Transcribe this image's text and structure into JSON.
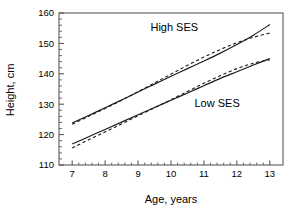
{
  "chart_data": {
    "type": "line",
    "title": "",
    "xlabel": "Age, years",
    "ylabel": "Height, cm",
    "xlim": [
      6.6,
      13.4
    ],
    "ylim": [
      110,
      160
    ],
    "xticks": [
      7,
      8,
      9,
      10,
      11,
      12,
      13
    ],
    "yticks": [
      110,
      120,
      130,
      140,
      150,
      160
    ],
    "xtick_labels": [
      "7",
      "8",
      "9",
      "10",
      "11",
      "12",
      "13"
    ],
    "ytick_labels": [
      "110",
      "120",
      "130",
      "140",
      "150",
      "160"
    ],
    "x_minor_step": 0.2,
    "y_minor_step": 2,
    "grid": false,
    "legend_position": "inline-annotations",
    "annotations": [
      {
        "text": "High SES",
        "x": 10.1,
        "y": 154.2
      },
      {
        "text": "Low SES",
        "x": 11.4,
        "y": 129.2
      }
    ],
    "series": [
      {
        "name": "High SES observed",
        "style": "solid",
        "x": [
          7.0,
          7.5,
          8.0,
          8.5,
          9.0,
          9.5,
          10.0,
          10.5,
          11.0,
          11.5,
          12.0,
          12.5,
          13.0
        ],
        "y": [
          123.8,
          126.3,
          128.8,
          131.4,
          134.0,
          136.6,
          139.2,
          141.7,
          144.2,
          146.8,
          149.6,
          152.7,
          156.2
        ]
      },
      {
        "name": "High SES fitted",
        "style": "dashed",
        "x": [
          7.0,
          7.5,
          8.0,
          8.5,
          9.0,
          9.5,
          10.0,
          10.5,
          11.0,
          11.5,
          12.0,
          12.5,
          13.0
        ],
        "y": [
          123.4,
          126.0,
          128.6,
          131.3,
          134.1,
          137.0,
          139.9,
          142.8,
          145.5,
          148.0,
          150.2,
          152.0,
          153.4
        ]
      },
      {
        "name": "Low SES observed",
        "style": "solid",
        "x": [
          7.0,
          7.5,
          8.0,
          8.5,
          9.0,
          9.5,
          10.0,
          10.5,
          11.0,
          11.5,
          12.0,
          12.5,
          13.0
        ],
        "y": [
          116.9,
          119.3,
          121.7,
          124.1,
          126.5,
          128.9,
          131.3,
          133.7,
          136.1,
          138.5,
          140.7,
          142.9,
          145.0
        ]
      },
      {
        "name": "Low SES fitted",
        "style": "dashed",
        "x": [
          7.0,
          7.5,
          8.0,
          8.5,
          9.0,
          9.5,
          10.0,
          10.5,
          11.0,
          11.5,
          12.0,
          12.5,
          13.0
        ],
        "y": [
          115.6,
          118.3,
          120.9,
          123.5,
          126.2,
          128.8,
          131.5,
          134.2,
          136.9,
          139.4,
          141.7,
          143.5,
          144.6
        ]
      }
    ]
  }
}
